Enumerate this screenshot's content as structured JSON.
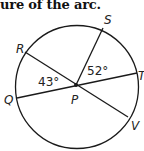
{
  "heading": "ure of the arc.",
  "diagram": {
    "center_label": "P",
    "points": {
      "R": "R",
      "S": "S",
      "T": "T",
      "Q": "Q",
      "V": "V"
    },
    "angles": {
      "RPQ": "43°",
      "SPT": "52°"
    },
    "segments": [
      "RV",
      "QT",
      "PS"
    ],
    "stroke_color": "#1a1a1a"
  }
}
